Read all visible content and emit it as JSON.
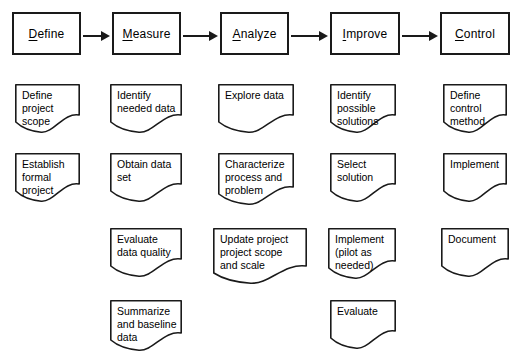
{
  "diagram": {
    "background_color": "#ffffff",
    "line_color": "#1a1a1a"
  },
  "phases": [
    {
      "id": "define",
      "label_first": "D",
      "label_rest": "efine",
      "x": 12,
      "y": 12,
      "w": 69,
      "h": 43
    },
    {
      "id": "measure",
      "label_first": "M",
      "label_rest": "easure",
      "x": 112,
      "y": 12,
      "w": 69,
      "h": 43
    },
    {
      "id": "analyze",
      "label_first": "A",
      "label_rest": "nalyze",
      "x": 220,
      "y": 12,
      "w": 69,
      "h": 43
    },
    {
      "id": "improve",
      "label_first": "I",
      "label_rest": "mprove",
      "x": 330,
      "y": 12,
      "w": 70,
      "h": 43
    },
    {
      "id": "control",
      "label_first": "C",
      "label_rest": "ontrol",
      "x": 440,
      "y": 12,
      "w": 70,
      "h": 43
    }
  ],
  "arrows": [
    {
      "id": "define-to-measure",
      "x": 83,
      "y": 28,
      "w": 27
    },
    {
      "id": "measure-to-analyze",
      "x": 183,
      "y": 28,
      "w": 35
    },
    {
      "id": "analyze-to-improve",
      "x": 291,
      "y": 28,
      "w": 37
    },
    {
      "id": "improve-to-control",
      "x": 402,
      "y": 28,
      "w": 36
    }
  ],
  "documents": [
    {
      "id": "define-project-scope",
      "phase": "define",
      "text": "Define\nproject\nscope",
      "x": 15,
      "y": 84,
      "w": 65,
      "h": 50,
      "align": "left"
    },
    {
      "id": "identify-needed-data",
      "phase": "measure",
      "text": "Identify\nneeded data",
      "x": 110,
      "y": 84,
      "w": 72,
      "h": 50,
      "align": "left"
    },
    {
      "id": "explore-data",
      "phase": "analyze",
      "text": "Explore data",
      "x": 218,
      "y": 84,
      "w": 76,
      "h": 50,
      "align": "left"
    },
    {
      "id": "identify-possible-solutions",
      "phase": "improve",
      "text": "Identify\npossible\nsolutions",
      "x": 330,
      "y": 84,
      "w": 66,
      "h": 50,
      "align": "left"
    },
    {
      "id": "define-control-method",
      "phase": "control",
      "text": "Define\ncontrol\nmethod",
      "x": 443,
      "y": 84,
      "w": 64,
      "h": 50,
      "align": "left"
    },
    {
      "id": "establish-formal-project",
      "phase": "define",
      "text": "Establish\nformal\nproject",
      "x": 15,
      "y": 153,
      "w": 65,
      "h": 50,
      "align": "left"
    },
    {
      "id": "obtain-data-set",
      "phase": "measure",
      "text": "Obtain data\nset",
      "x": 110,
      "y": 153,
      "w": 72,
      "h": 50,
      "align": "left"
    },
    {
      "id": "characterize-process",
      "phase": "analyze",
      "text": "Characterize\nprocess and\nproblem",
      "x": 218,
      "y": 153,
      "w": 76,
      "h": 53,
      "align": "left"
    },
    {
      "id": "select-solution",
      "phase": "improve",
      "text": "Select\nsolution",
      "x": 330,
      "y": 153,
      "w": 66,
      "h": 50,
      "align": "left"
    },
    {
      "id": "implement",
      "phase": "control",
      "text": "Implement",
      "x": 443,
      "y": 153,
      "w": 64,
      "h": 50,
      "align": "left"
    },
    {
      "id": "evaluate-data-quality",
      "phase": "measure",
      "text": "Evaluate\ndata quality",
      "x": 110,
      "y": 228,
      "w": 72,
      "h": 50,
      "align": "left"
    },
    {
      "id": "update-project-scope",
      "phase": "analyze",
      "text": "Update project\nproject scope\nand scale",
      "x": 213,
      "y": 228,
      "w": 94,
      "h": 57,
      "align": "left"
    },
    {
      "id": "implement-pilot",
      "phase": "improve",
      "text": "Implement\n(pilot as\nneeded)",
      "x": 328,
      "y": 228,
      "w": 68,
      "h": 52,
      "align": "left"
    },
    {
      "id": "document",
      "phase": "control",
      "text": "Document",
      "x": 441,
      "y": 228,
      "w": 68,
      "h": 50,
      "align": "left"
    },
    {
      "id": "summarize-baseline-data",
      "phase": "measure",
      "text": "Summarize\nand baseline\ndata",
      "x": 110,
      "y": 300,
      "w": 72,
      "h": 52,
      "align": "left"
    },
    {
      "id": "evaluate",
      "phase": "improve",
      "text": "Evaluate",
      "x": 330,
      "y": 300,
      "w": 66,
      "h": 50,
      "align": "left"
    }
  ]
}
